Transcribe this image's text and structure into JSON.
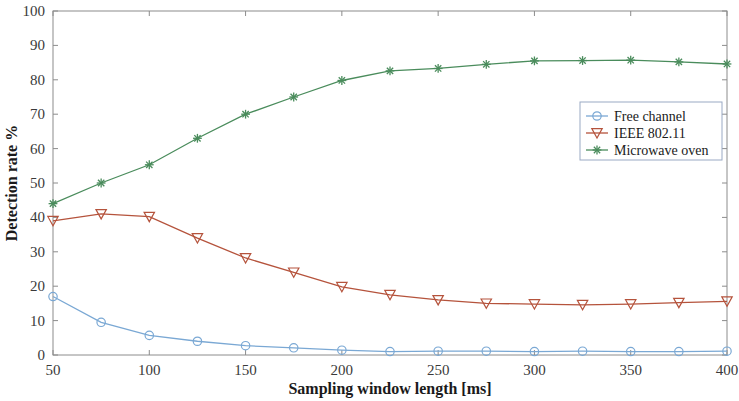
{
  "chart_data": {
    "type": "line",
    "title": "",
    "xlabel": "Sampling window length [ms]",
    "ylabel": "Detection rate %",
    "xlim": [
      50,
      400
    ],
    "ylim": [
      0,
      100
    ],
    "xticks": [
      50,
      100,
      150,
      200,
      250,
      300,
      350,
      400
    ],
    "xtick_labels": [
      "50",
      "100",
      "150",
      "200",
      "250",
      "300",
      "350",
      "400"
    ],
    "yticks": [
      0,
      10,
      20,
      30,
      40,
      50,
      60,
      70,
      80,
      90,
      100
    ],
    "ytick_labels": [
      "0",
      "10",
      "20",
      "30",
      "40",
      "50",
      "60",
      "70",
      "80",
      "90",
      "100"
    ],
    "grid": false,
    "legend_position": "center-right",
    "x": [
      50,
      75,
      100,
      125,
      150,
      175,
      200,
      225,
      250,
      275,
      300,
      325,
      350,
      375,
      400
    ],
    "series": [
      {
        "name": "Free channel",
        "color": "#7aa8d4",
        "marker": "circle",
        "values": [
          17.0,
          9.5,
          5.7,
          4.0,
          2.7,
          2.1,
          1.4,
          1.0,
          1.1,
          1.1,
          1.0,
          1.1,
          1.0,
          1.0,
          1.1
        ]
      },
      {
        "name": "IEEE 802.11",
        "color": "#b5533c",
        "marker": "triangle-down",
        "values": [
          39.0,
          41.0,
          40.2,
          34.0,
          28.2,
          24.0,
          19.8,
          17.5,
          16.0,
          15.0,
          14.8,
          14.6,
          14.8,
          15.2,
          15.6
        ]
      },
      {
        "name": "Microwave oven",
        "color": "#4a8c5c",
        "marker": "asterisk",
        "values": [
          44.0,
          50.0,
          55.3,
          63.0,
          70.0,
          75.0,
          79.8,
          82.6,
          83.3,
          84.5,
          85.5,
          85.6,
          85.7,
          85.2,
          84.6
        ]
      }
    ]
  },
  "axes": {
    "xlabel": "Sampling window length [ms]",
    "ylabel": "Detection rate %"
  },
  "legend": {
    "entries": [
      {
        "label": "Free channel"
      },
      {
        "label": "IEEE 802.11"
      },
      {
        "label": "Microwave oven"
      }
    ]
  }
}
